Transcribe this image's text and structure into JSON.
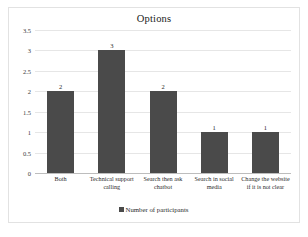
{
  "chart": {
    "title": "Options",
    "legend_label": "Number of participants",
    "legend_marker": "square-marker-icon"
  },
  "chart_data": {
    "type": "bar",
    "title": "Options",
    "xlabel": "",
    "ylabel": "",
    "ylim": [
      0,
      3.5
    ],
    "grid": true,
    "legend_position": "bottom-center",
    "categories": [
      "Both",
      "Technical support calling",
      "Search then ask chatbot",
      "Search in social media",
      "Change the website if it is not clear"
    ],
    "values": [
      2,
      3,
      2,
      1,
      1
    ],
    "series": [
      {
        "name": "Number of participants",
        "values": [
          2,
          3,
          2,
          1,
          1
        ],
        "color": "#4A4A4A"
      }
    ],
    "yticks": [
      "0",
      "0.5",
      "1",
      "1.5",
      "2",
      "2.5",
      "3",
      "3.5"
    ],
    "ytick_values": [
      0,
      0.5,
      1,
      1.5,
      2,
      2.5,
      3,
      3.5
    ],
    "data_labels": [
      "2",
      "3",
      "2",
      "1",
      "1"
    ]
  },
  "colors": {
    "bar": "#4A4A4A",
    "gridline": "#E6E6E6",
    "axis": "#BDBDBD",
    "border": "#E2E2E2",
    "text": "#2B2B2B"
  }
}
